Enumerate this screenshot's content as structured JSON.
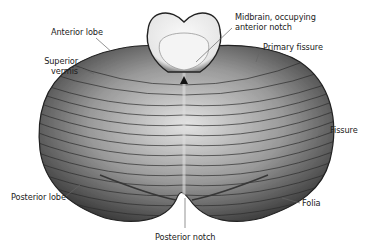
{
  "figure": {
    "labels": {
      "anterior_lobe": "Anterior lobe",
      "superior_vermis_line1": "Superior",
      "superior_vermis_line2": "vermis",
      "midbrain_line1": "Midbrain, occupying",
      "midbrain_line2": "anterior notch",
      "primary_fissure": "Primary fissure",
      "fissure": "Fissure",
      "posterior_lobe": "Posterior lobe",
      "folia": "Folia",
      "posterior_notch": "Posterior notch"
    },
    "colors": {
      "background": "#ffffff",
      "tissue_dark": "#2a2a2a",
      "tissue_mid": "#7a7a7a",
      "tissue_light": "#d8d8d8",
      "midbrain": "#f2f2f2",
      "leader_line": "#555555",
      "label_text": "#222222"
    }
  }
}
